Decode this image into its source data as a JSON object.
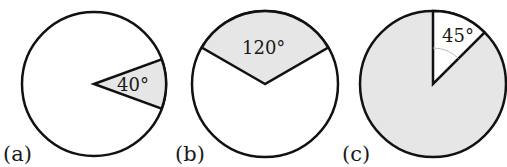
{
  "figure": {
    "panels": [
      {
        "label": "(a)",
        "angle_label": "40°",
        "angle_deg": 40,
        "shaded": "sector"
      },
      {
        "label": "(b)",
        "angle_label": "120°",
        "angle_deg": 120,
        "shaded": "sector"
      },
      {
        "label": "(c)",
        "angle_label": "45°",
        "angle_deg": 45,
        "shaded": "complement"
      }
    ],
    "colors": {
      "stroke": "#111111",
      "shade": "#e6e6e6",
      "background": "#ffffff",
      "arc_mark": "#bbbbbb"
    }
  }
}
